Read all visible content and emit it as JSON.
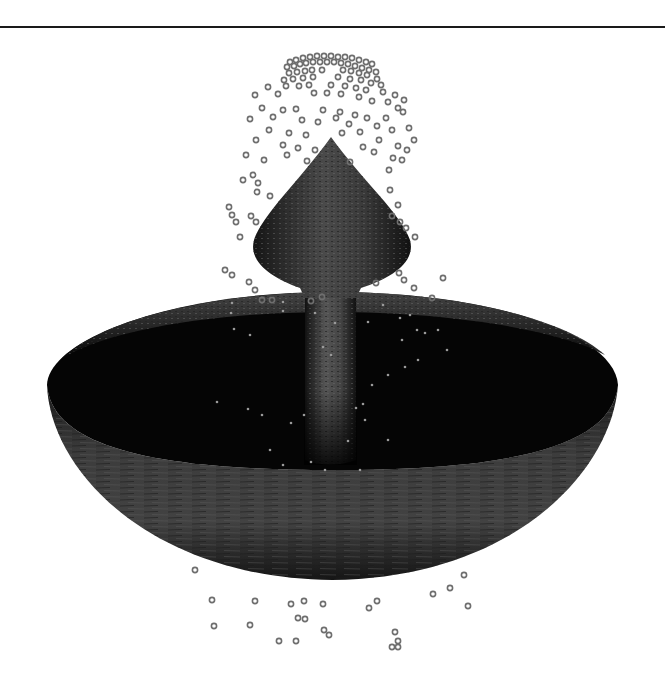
{
  "scene": {
    "description": "3D rendered stone fountain with particle water spray",
    "colors": {
      "background": "#ffffff",
      "rule": "#1a1a1a",
      "stone_dark": "#0a0a0a",
      "stone_mid": "#3a3a3a",
      "stone_light": "#5a5a5a",
      "particle_stroke": "#6e6e6e"
    },
    "particles_outside": [
      [
        290,
        62
      ],
      [
        296,
        60
      ],
      [
        303,
        58
      ],
      [
        310,
        57
      ],
      [
        317,
        56
      ],
      [
        324,
        56
      ],
      [
        331,
        56
      ],
      [
        338,
        57
      ],
      [
        345,
        57
      ],
      [
        352,
        58
      ],
      [
        359,
        60
      ],
      [
        366,
        62
      ],
      [
        372,
        64
      ],
      [
        287,
        67
      ],
      [
        294,
        66
      ],
      [
        300,
        64
      ],
      [
        306,
        63
      ],
      [
        313,
        62
      ],
      [
        320,
        62
      ],
      [
        327,
        62
      ],
      [
        334,
        62
      ],
      [
        341,
        63
      ],
      [
        348,
        64
      ],
      [
        355,
        66
      ],
      [
        362,
        68
      ],
      [
        369,
        70
      ],
      [
        376,
        72
      ],
      [
        289,
        73
      ],
      [
        297,
        72
      ],
      [
        305,
        71
      ],
      [
        312,
        70
      ],
      [
        322,
        70
      ],
      [
        343,
        70
      ],
      [
        351,
        71
      ],
      [
        359,
        73
      ],
      [
        367,
        75
      ],
      [
        377,
        79
      ],
      [
        284,
        80
      ],
      [
        293,
        79
      ],
      [
        303,
        78
      ],
      [
        313,
        77
      ],
      [
        338,
        77
      ],
      [
        350,
        79
      ],
      [
        361,
        80
      ],
      [
        371,
        83
      ],
      [
        381,
        85
      ],
      [
        268,
        87
      ],
      [
        286,
        86
      ],
      [
        299,
        86
      ],
      [
        309,
        85
      ],
      [
        331,
        85
      ],
      [
        345,
        86
      ],
      [
        356,
        88
      ],
      [
        366,
        90
      ],
      [
        383,
        92
      ],
      [
        395,
        95
      ],
      [
        404,
        100
      ],
      [
        255,
        95
      ],
      [
        278,
        94
      ],
      [
        314,
        93
      ],
      [
        327,
        93
      ],
      [
        341,
        94
      ],
      [
        359,
        97
      ],
      [
        372,
        101
      ],
      [
        388,
        102
      ],
      [
        398,
        108
      ],
      [
        262,
        108
      ],
      [
        283,
        110
      ],
      [
        296,
        109
      ],
      [
        323,
        110
      ],
      [
        340,
        112
      ],
      [
        355,
        115
      ],
      [
        367,
        118
      ],
      [
        386,
        118
      ],
      [
        403,
        112
      ],
      [
        250,
        119
      ],
      [
        273,
        117
      ],
      [
        302,
        120
      ],
      [
        318,
        122
      ],
      [
        336,
        118
      ],
      [
        349,
        124
      ],
      [
        377,
        126
      ],
      [
        392,
        130
      ],
      [
        409,
        128
      ],
      [
        414,
        140
      ],
      [
        269,
        130
      ],
      [
        289,
        133
      ],
      [
        306,
        135
      ],
      [
        342,
        133
      ],
      [
        360,
        132
      ],
      [
        379,
        140
      ],
      [
        398,
        146
      ],
      [
        407,
        150
      ],
      [
        256,
        140
      ],
      [
        283,
        145
      ],
      [
        298,
        148
      ],
      [
        315,
        150
      ],
      [
        363,
        147
      ],
      [
        374,
        152
      ],
      [
        393,
        158
      ],
      [
        402,
        160
      ],
      [
        246,
        155
      ],
      [
        264,
        160
      ],
      [
        287,
        155
      ],
      [
        307,
        161
      ],
      [
        350,
        162
      ],
      [
        389,
        170
      ],
      [
        253,
        175
      ],
      [
        243,
        180
      ],
      [
        258,
        183
      ],
      [
        390,
        190
      ],
      [
        398,
        205
      ],
      [
        229,
        207
      ],
      [
        232,
        215
      ],
      [
        236,
        222
      ],
      [
        257,
        192
      ],
      [
        270,
        196
      ],
      [
        400,
        222
      ],
      [
        251,
        216
      ],
      [
        256,
        222
      ],
      [
        392,
        216
      ],
      [
        406,
        228
      ],
      [
        415,
        237
      ],
      [
        240,
        237
      ],
      [
        225,
        270
      ],
      [
        232,
        275
      ],
      [
        249,
        282
      ],
      [
        255,
        290
      ],
      [
        399,
        273
      ],
      [
        414,
        288
      ],
      [
        404,
        280
      ],
      [
        443,
        278
      ],
      [
        262,
        300
      ],
      [
        272,
        300
      ],
      [
        311,
        301
      ],
      [
        322,
        297
      ],
      [
        376,
        283
      ],
      [
        432,
        298
      ],
      [
        195,
        570
      ],
      [
        464,
        575
      ],
      [
        450,
        588
      ],
      [
        212,
        600
      ],
      [
        255,
        601
      ],
      [
        291,
        604
      ],
      [
        304,
        601
      ],
      [
        323,
        604
      ],
      [
        369,
        608
      ],
      [
        377,
        601
      ],
      [
        433,
        594
      ],
      [
        468,
        606
      ],
      [
        214,
        626
      ],
      [
        250,
        625
      ],
      [
        298,
        618
      ],
      [
        305,
        619
      ],
      [
        324,
        630
      ],
      [
        329,
        635
      ],
      [
        395,
        632
      ],
      [
        398,
        641
      ],
      [
        392,
        647
      ],
      [
        398,
        647
      ],
      [
        279,
        641
      ],
      [
        296,
        641
      ]
    ],
    "particles_inside": [
      [
        232,
        303
      ],
      [
        231,
        313
      ],
      [
        234,
        329
      ],
      [
        250,
        335
      ],
      [
        283,
        302
      ],
      [
        283,
        311
      ],
      [
        315,
        313
      ],
      [
        323,
        347
      ],
      [
        335,
        323
      ],
      [
        368,
        322
      ],
      [
        383,
        305
      ],
      [
        400,
        318
      ],
      [
        410,
        315
      ],
      [
        417,
        330
      ],
      [
        402,
        340
      ],
      [
        438,
        330
      ],
      [
        447,
        350
      ],
      [
        405,
        367
      ],
      [
        418,
        360
      ],
      [
        425,
        333
      ],
      [
        388,
        375
      ],
      [
        372,
        385
      ],
      [
        331,
        355
      ],
      [
        363,
        404
      ],
      [
        365,
        420
      ],
      [
        348,
        441
      ],
      [
        217,
        402
      ],
      [
        248,
        409
      ],
      [
        262,
        415
      ],
      [
        291,
        423
      ],
      [
        270,
        450
      ],
      [
        283,
        465
      ],
      [
        304,
        415
      ],
      [
        311,
        462
      ],
      [
        325,
        470
      ],
      [
        356,
        408
      ],
      [
        360,
        470
      ],
      [
        388,
        440
      ]
    ]
  }
}
